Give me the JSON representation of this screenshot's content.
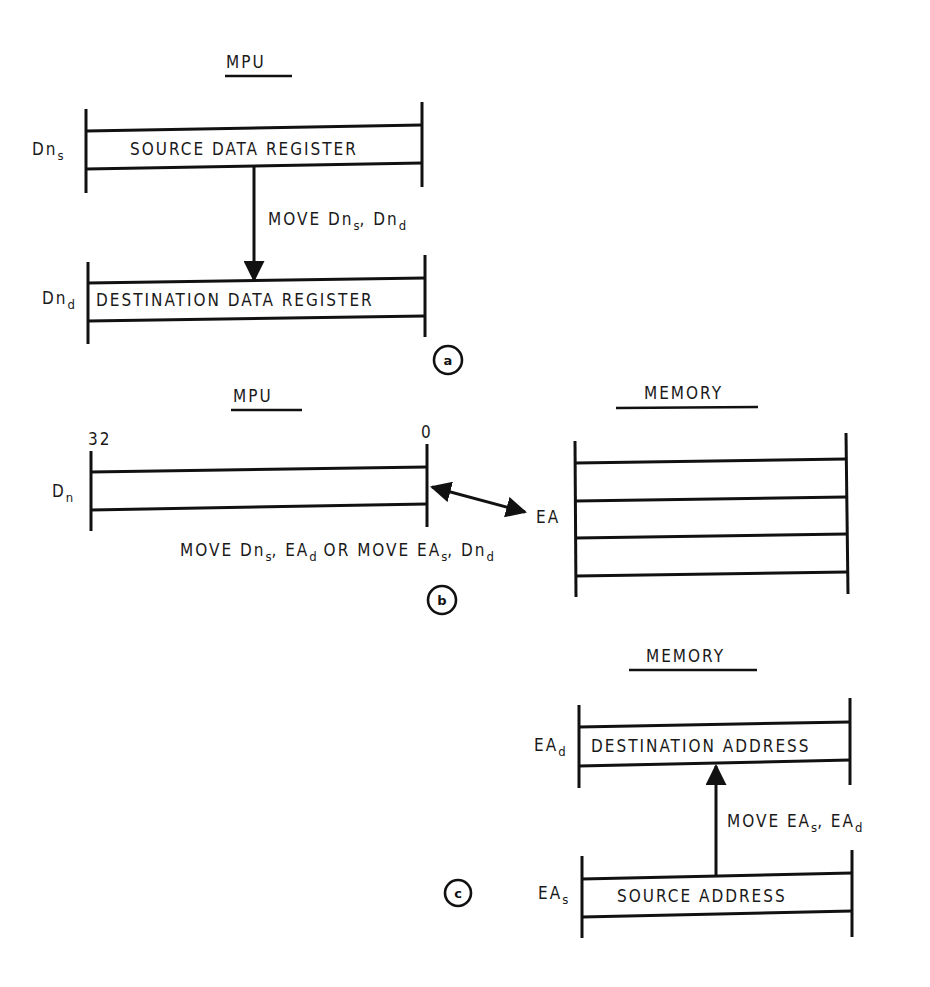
{
  "panel_a": {
    "id_label": "a",
    "header": "MPU",
    "source_register": {
      "name_main": "Dn",
      "name_sub": "s",
      "text": "SOURCE DATA REGISTER"
    },
    "dest_register": {
      "name_main": "Dn",
      "name_sub": "d",
      "text": "DESTINATION DATA REGISTER"
    },
    "instruction": {
      "p1": "MOVE Dn",
      "s1": "s",
      "p2": ", Dn",
      "s2": "d"
    }
  },
  "panel_b": {
    "id_label": "b",
    "mpu_header": "MPU",
    "memory_header": "MEMORY",
    "register": {
      "name_main": "D",
      "name_sub": "n",
      "bit_high": "32",
      "bit_low": "0"
    },
    "memory_location_label": "EA",
    "instruction": {
      "p1": "MOVE Dn",
      "s1": "s",
      "p2": ", EA",
      "s2": "d",
      "p3": " OR MOVE EA",
      "s3": "s",
      "p4": ", Dn",
      "s4": "d"
    }
  },
  "panel_c": {
    "id_label": "c",
    "header": "MEMORY",
    "dest": {
      "name_main": "EA",
      "name_sub": "d",
      "text": "DESTINATION ADDRESS"
    },
    "source": {
      "name_main": "EA",
      "name_sub": "s",
      "text": "SOURCE ADDRESS"
    },
    "instruction": {
      "p1": "MOVE EA",
      "s1": "s",
      "p2": ", EA",
      "s2": "d"
    }
  }
}
